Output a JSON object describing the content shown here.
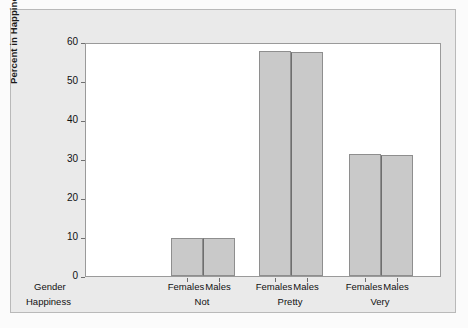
{
  "chart_data": {
    "type": "bar",
    "title": "",
    "xlabel": "",
    "ylabel": "Percent in Happiness Category",
    "ylim": [
      0,
      60
    ],
    "yticks": [
      0,
      10,
      20,
      30,
      40,
      50,
      60
    ],
    "grid": false,
    "legend": null,
    "group_axis_rows": [
      {
        "name": "Gender",
        "label": "Gender"
      },
      {
        "name": "Happiness",
        "label": "Happiness"
      }
    ],
    "categories": [
      "Not",
      "Pretty",
      "Very"
    ],
    "subcategories": [
      "Females",
      "Males"
    ],
    "series": [
      {
        "name": "Females",
        "values": [
          9.8,
          57.7,
          31.2
        ]
      },
      {
        "name": "Males",
        "values": [
          9.8,
          57.5,
          31.1
        ]
      }
    ],
    "groups": [
      {
        "happiness": "Not",
        "bars": [
          {
            "gender": "Females",
            "value": 9.8
          },
          {
            "gender": "Males",
            "value": 9.8
          }
        ]
      },
      {
        "happiness": "Pretty",
        "bars": [
          {
            "gender": "Females",
            "value": 57.7
          },
          {
            "gender": "Males",
            "value": 57.5
          }
        ]
      },
      {
        "happiness": "Very",
        "bars": [
          {
            "gender": "Females",
            "value": 31.2
          },
          {
            "gender": "Males",
            "value": 31.1
          }
        ]
      }
    ],
    "colors": {
      "bar_fill": "#c9c9c9",
      "bar_edge": "#8e8e8e",
      "plot_background": "#ffffff",
      "figure_background": "#eaeaea",
      "axis": "#6f6f6f",
      "text": "#111111"
    }
  },
  "axis": {
    "y_title": "Percent in Happiness Category",
    "tick_labels": [
      "0",
      "10",
      "20",
      "30",
      "40",
      "50",
      "60"
    ]
  },
  "x_axis": {
    "row_labels": [
      "Gender",
      "Happiness"
    ],
    "gender_labels": [
      "Females",
      "Males",
      "Females",
      "Males",
      "Females",
      "Males"
    ],
    "happiness_labels": [
      "Not",
      "Pretty",
      "Very"
    ]
  }
}
